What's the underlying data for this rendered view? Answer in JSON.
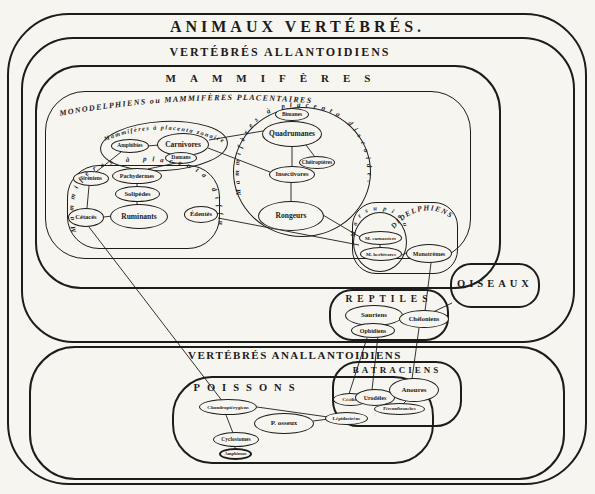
{
  "diagram": {
    "title": "ANIMAUX VERTÉBRÉS.",
    "ink_color": "#1c1c1c",
    "paper_color": "#f7f5f0",
    "groups": {
      "allantoidiens": "VERTÉBRÉS ALLANTOIDIENS",
      "mammiferes": "MAMMIFÈRES",
      "monodelphiens": "MONODELPHIENS ou MAMMIFÈRES PLACENTAIRES",
      "zonaire": "Mammifères à placenta zonaire.",
      "diffus": "Mammifères à placenta diffus.",
      "discoide": "Mammifères à placenta discoide.",
      "didelphiens": "DIDELPHIENS",
      "marsupiaux": "Marsupiaux",
      "oiseaux": "OISEAUX",
      "reptiles": "REPTILES",
      "anallantoidiens": "VERTÉBRÉS ANALLANTOIDIENS",
      "poissons": "POISSONS",
      "batraciens": "BATRACIENS"
    },
    "taxa": {
      "amphibies": "Amphibies",
      "carnivores": "Carnivores",
      "damans": "Damans",
      "sireniens": "Siréniens",
      "pachydermes": "Pachydermes",
      "solipedes": "Solipèdes",
      "ruminants": "Ruminants",
      "cetaces": "Cétacés",
      "edentes": "Édentés",
      "bimanes": "Bimanes",
      "quadrumanes": "Quadrumanes",
      "cheiropteres": "Chéiroptères",
      "insectivores": "Insectivores",
      "rongeurs": "Rongeurs",
      "m_carnassiers": "M. carnassiers",
      "m_herbivores": "M. herbivores",
      "monotremes": "Monotrèmes",
      "sauriens": "Sauriens",
      "ophidiens": "Ophidiens",
      "cheloniens": "Chéloniens",
      "chondropterygiens": "Chondroptérygiens",
      "p_osseux": "P. osseux",
      "cyclostomes": "Cyclostomes",
      "amphioxus": "Amphioxus",
      "lepidosirene": "Lépidosirène",
      "cecilies": "Cécilies",
      "urodeles": "Urodèles",
      "anoures": "Anoures",
      "perennibranches": "Pérennibranches"
    },
    "connections": [
      [
        "amphibies",
        "carnivores"
      ],
      [
        "damans",
        "pachydermes"
      ],
      [
        "amphibies",
        "sireniens"
      ],
      [
        "sireniens",
        "cetaces"
      ],
      [
        "pachydermes",
        "solipedes"
      ],
      [
        "solipedes",
        "ruminants"
      ],
      [
        "cetaces",
        "ruminants"
      ],
      [
        "carnivores",
        "quadrumanes"
      ],
      [
        "carnivores",
        "insectivores"
      ],
      [
        "quadrumanes",
        "cheiropteres"
      ],
      [
        "quadrumanes",
        "insectivores"
      ],
      [
        "insectivores",
        "rongeurs"
      ],
      [
        "rongeurs",
        "m_carnassiers"
      ],
      [
        "edentes",
        "marsupiaux"
      ],
      [
        "m_carnassiers",
        "m_herbivores"
      ],
      [
        "m_herbivores",
        "monotremes"
      ],
      [
        "monotremes",
        "cheloniens"
      ],
      [
        "oiseaux",
        "cheloniens"
      ],
      [
        "sauriens",
        "urodeles"
      ],
      [
        "ophidiens",
        "cecilies"
      ],
      [
        "cheloniens",
        "anoures"
      ],
      [
        "cetaces",
        "chondropterygiens"
      ],
      [
        "chondropterygiens",
        "lepidosirene"
      ],
      [
        "p_osseux",
        "lepidosirene"
      ],
      [
        "chondropterygiens",
        "cyclostomes"
      ],
      [
        "cyclostomes",
        "amphioxus"
      ],
      [
        "cecilies",
        "urodeles"
      ],
      [
        "urodeles",
        "anoures"
      ],
      [
        "anoures",
        "perennibranches"
      ]
    ]
  }
}
